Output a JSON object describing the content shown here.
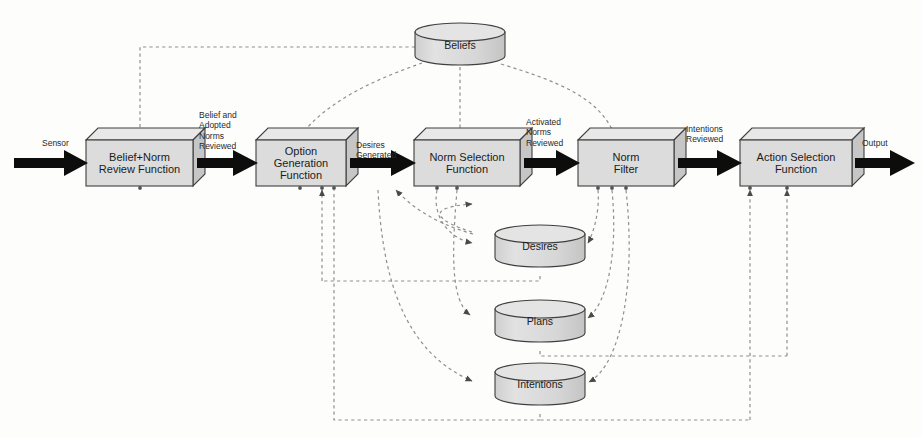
{
  "diagram": {
    "style": {
      "box_fill": "#d9d9d9",
      "box_top_fill": "#e6e6e6",
      "box_side_fill": "#c9c9c9",
      "stroke": "#3a3a3a",
      "flow_arrow_color": "#101010",
      "dashed_color": "#8a8a8a",
      "background": "#fdfdfc"
    },
    "processes": [
      {
        "id": "belief-norm-review-function",
        "label": "Belief+Norm\nReview Function",
        "x": 86,
        "y": 140,
        "w": 107,
        "h": 46,
        "depth": 12
      },
      {
        "id": "option-generation-function",
        "label": "Option\nGeneration\nFunction",
        "x": 256,
        "y": 140,
        "w": 90,
        "h": 46,
        "depth": 12
      },
      {
        "id": "norm-selection-function",
        "label": "Norm Selection\nFunction",
        "x": 414,
        "y": 140,
        "w": 106,
        "h": 46,
        "depth": 12
      },
      {
        "id": "norm-filter",
        "label": "Norm\nFilter",
        "x": 578,
        "y": 140,
        "w": 96,
        "h": 46,
        "depth": 12
      },
      {
        "id": "action-selection-function",
        "label": "Action Selection\nFunction",
        "x": 740,
        "y": 140,
        "w": 112,
        "h": 46,
        "depth": 12
      }
    ],
    "stores": [
      {
        "id": "beliefs",
        "label": "Beliefs",
        "cx": 460,
        "cy": 44,
        "rx": 45,
        "ry": 9,
        "h": 30
      },
      {
        "id": "desires",
        "label": "Desires",
        "cx": 540,
        "cy": 245,
        "rx": 45,
        "ry": 9,
        "h": 30
      },
      {
        "id": "plans",
        "label": "Plans",
        "cx": 540,
        "cy": 320,
        "rx": 45,
        "ry": 9,
        "h": 30
      },
      {
        "id": "intentions",
        "label": "Intentions",
        "cx": 540,
        "cy": 383,
        "rx": 45,
        "ry": 9,
        "h": 30
      }
    ],
    "flow_labels": [
      {
        "id": "sensor",
        "text": "Sensor",
        "x": 42,
        "y": 139
      },
      {
        "id": "belief-adopted-norms-rev",
        "text": "Belief and\nAdopted\nNorms\nReviewed",
        "x": 199,
        "y": 110
      },
      {
        "id": "desires-generated",
        "text": "Desires\nGenerated",
        "x": 356,
        "y": 142
      },
      {
        "id": "activated-norms-reviewed",
        "text": "Activated\nNorms\nReviewed",
        "x": 526,
        "y": 117
      },
      {
        "id": "intentions-reviewed",
        "text": "Intentions\nReviewed",
        "x": 686,
        "y": 124
      },
      {
        "id": "output",
        "text": "Output",
        "x": 862,
        "y": 139
      }
    ],
    "flow_arrows": [
      {
        "id": "sensor-to-belief-review",
        "x1": 14,
        "x2": 86,
        "y": 163
      },
      {
        "id": "belief-review-to-option-gen",
        "x1": 194,
        "x2": 256,
        "y": 163
      },
      {
        "id": "option-gen-to-norm-selection",
        "x1": 347,
        "x2": 414,
        "y": 163
      },
      {
        "id": "norm-selection-to-norm-filter",
        "x1": 521,
        "x2": 578,
        "y": 163
      },
      {
        "id": "norm-filter-to-action-selection",
        "x1": 675,
        "x2": 740,
        "y": 163
      },
      {
        "id": "action-selection-to-output",
        "x1": 853,
        "x2": 912,
        "y": 163
      }
    ],
    "dashed_links": [
      {
        "id": "beliefs-to-belief-review",
        "from": "beliefs",
        "to": "belief-norm-review-function"
      },
      {
        "id": "beliefs-to-option-generation",
        "from": "beliefs",
        "to": "option-generation-function"
      },
      {
        "id": "beliefs-to-norm-selection",
        "from": "beliefs",
        "to": "norm-selection-function"
      },
      {
        "id": "beliefs-to-norm-filter",
        "from": "beliefs",
        "to": "norm-filter"
      },
      {
        "id": "option-generation-to-desires",
        "from": "option-generation-function",
        "to": "desires"
      },
      {
        "id": "option-generation-to-intentions",
        "from": "option-generation-function",
        "to": "intentions"
      },
      {
        "id": "norm-selection-to-desires",
        "from": "norm-selection-function",
        "to": "desires"
      },
      {
        "id": "norm-selection-to-plans",
        "from": "norm-selection-function",
        "to": "plans"
      },
      {
        "id": "norm-filter-to-desires",
        "from": "norm-filter",
        "to": "desires"
      },
      {
        "id": "norm-filter-to-plans",
        "from": "norm-filter",
        "to": "plans"
      },
      {
        "id": "norm-filter-to-intentions",
        "from": "norm-filter",
        "to": "intentions"
      },
      {
        "id": "desires-bus-to-option-generation",
        "from": "desires",
        "to": "option-generation-function"
      },
      {
        "id": "plans-bus-to-action-selection",
        "from": "plans",
        "to": "action-selection-function"
      },
      {
        "id": "intentions-bus-to-action-selection",
        "from": "intentions",
        "to": "action-selection-function"
      }
    ]
  }
}
